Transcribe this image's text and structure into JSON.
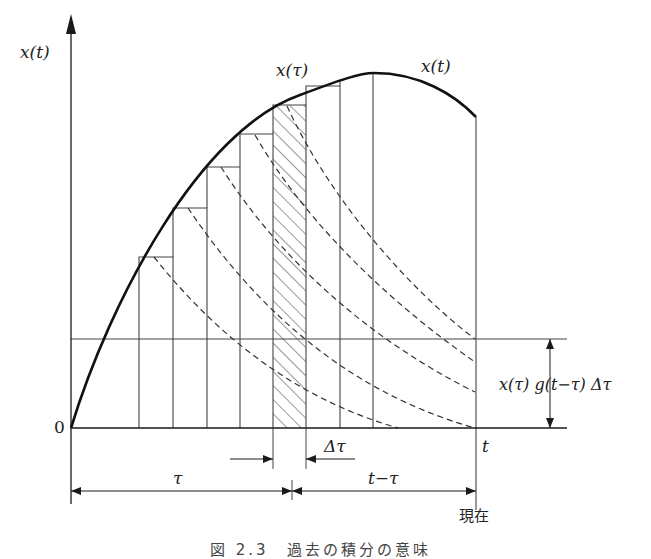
{
  "figure": {
    "caption": "図 2.3　過去の積分の意味",
    "caption_visibility": "clipped at bottom edge",
    "colors": {
      "ink": "#1a1a1a",
      "thin_line": "#444444",
      "background": "#ffffff"
    }
  },
  "labels": {
    "y_axis": "x(t)",
    "origin": "0",
    "x_tau_label": "x(τ)",
    "x_t_curve_label": "x(t)",
    "t_label": "t",
    "delta_tau": "Δτ",
    "tau_span": "τ",
    "t_minus_tau_span": "t−τ",
    "now": "現在",
    "response_height": "x(τ) g(t−τ) Δτ"
  },
  "geometry": {
    "axis_origin": [
      71,
      428
    ],
    "y_axis_top": 23,
    "baseline_right": 567,
    "reference_line_y": 339,
    "bar_edges_x": [
      139,
      173,
      207,
      240,
      273,
      306,
      340,
      373
    ],
    "bar_tops_y": [
      257,
      208,
      167,
      134,
      105,
      86,
      74
    ],
    "hatched_bar_index": 4,
    "current_time_x": 476,
    "curve_end_y": 117,
    "curve_peak": [
      374,
      73
    ]
  },
  "dashed_responses": [
    {
      "from_bar": 1,
      "start": [
        154,
        257
      ],
      "end": [
        398,
        428
      ]
    },
    {
      "from_bar": 2,
      "start": [
        188,
        208
      ],
      "end": [
        475,
        428
      ]
    },
    {
      "from_bar": 3,
      "start": [
        221,
        167
      ],
      "end": [
        475,
        392
      ]
    },
    {
      "from_bar": 4,
      "start": [
        255,
        135
      ],
      "end": [
        475,
        362
      ]
    },
    {
      "from_bar": 5,
      "start": [
        287,
        106
      ],
      "end": [
        475,
        339
      ]
    }
  ]
}
